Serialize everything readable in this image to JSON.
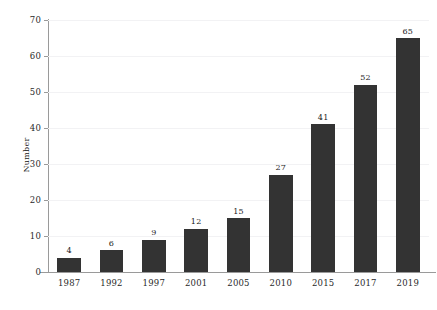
{
  "chart_data": {
    "type": "bar",
    "title": "",
    "subtitle": "",
    "xlabel": "",
    "ylabel": "Number",
    "categories": [
      "1987",
      "1992",
      "1997",
      "2001",
      "2005",
      "2010",
      "2015",
      "2017",
      "2019"
    ],
    "values": [
      4,
      6,
      9,
      12,
      15,
      27,
      41,
      52,
      65
    ],
    "value_labels": [
      "4",
      "6",
      "9",
      "12",
      "15",
      "27",
      "41",
      "52",
      "65"
    ],
    "ylim": [
      0,
      70
    ],
    "yticks": [
      0,
      10,
      20,
      30,
      40,
      50,
      60,
      70
    ],
    "ytick_labels": [
      "0",
      "10",
      "20",
      "30",
      "40",
      "50",
      "60",
      "70"
    ],
    "grid": true,
    "grid_axis": "y",
    "legend": false,
    "legend_position": "none",
    "bar_color": "#333333",
    "background_color": "#ffffff",
    "gridline_color": "#f2f2f4",
    "axis_color": "#9a9a9a",
    "text_color": "#1a1a1a"
  }
}
